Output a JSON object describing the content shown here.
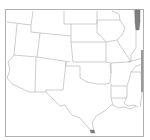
{
  "map": {
    "region": "South-Central United States",
    "highlighted_states": [
      {
        "name": "Illinois-east-strip",
        "color": "#7f7f7f"
      },
      {
        "name": "Texas-south-tip",
        "color": "#7f7f7f"
      }
    ],
    "border_color": "#b4b4b4",
    "frame_color": "#b0b0b0",
    "fill_color": "#ffffff"
  }
}
